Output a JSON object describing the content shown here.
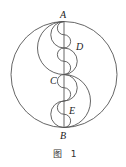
{
  "figure": {
    "caption": "图 1",
    "stroke_color": "#555555",
    "points": {
      "A": {
        "label": "A"
      },
      "B": {
        "label": "B"
      },
      "C": {
        "label": "C"
      },
      "D": {
        "label": "D"
      },
      "E": {
        "label": "E"
      }
    }
  }
}
